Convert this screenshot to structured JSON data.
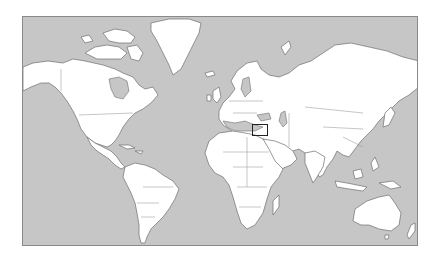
{
  "map": {
    "projection": "Mercator",
    "type": "world political outline map",
    "colors": {
      "ocean": "#c6c6c6",
      "land": "#ffffff",
      "coastline": "#6e6e6e",
      "frame": "#8a8a8a",
      "highlight": "#222222"
    },
    "frame": {
      "left": 22,
      "top": 16,
      "width": 396,
      "height": 230
    },
    "highlight": {
      "region": "Levant / Eastern Mediterranean (Israel, Lebanon, Jordan, Syria)",
      "left": 252,
      "top": 124,
      "width": 16,
      "height": 12
    }
  }
}
